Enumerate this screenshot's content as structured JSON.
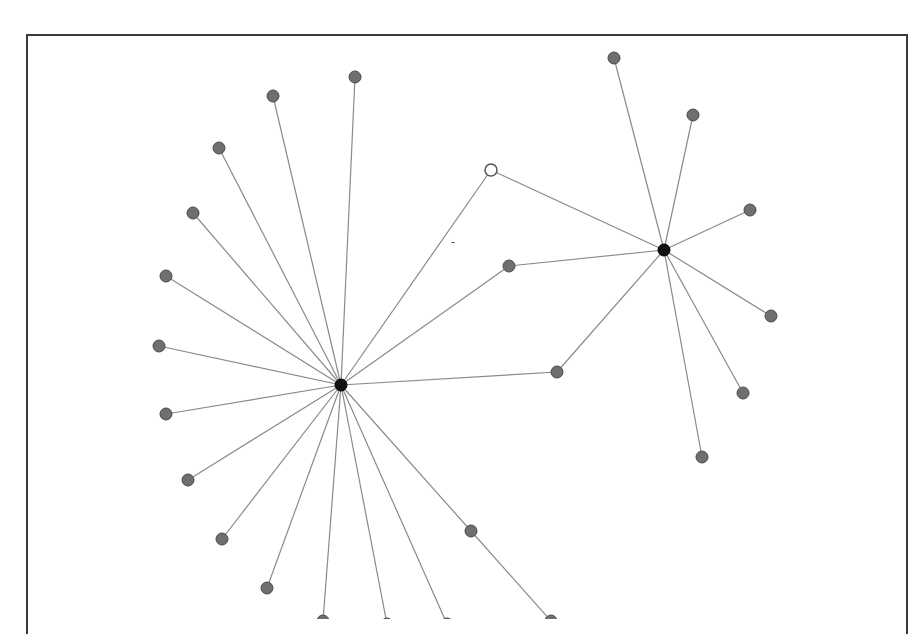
{
  "diagram": {
    "type": "network-graph",
    "title": "",
    "frame": {
      "border_color": "#3a3a3a",
      "background": "#ffffff"
    },
    "colors": {
      "edge": "#8a8a8a",
      "leaf_node": "#6f6f6f",
      "hub_node": "#111111",
      "open_node": "#ffffff"
    },
    "nodes": [
      {
        "id": "hub1",
        "kind": "hub",
        "x": 341,
        "y": 385,
        "r": 6
      },
      {
        "id": "hub2",
        "kind": "hub",
        "x": 664,
        "y": 250,
        "r": 6
      },
      {
        "id": "open1",
        "kind": "open",
        "x": 491,
        "y": 170,
        "r": 6
      },
      {
        "id": "b1",
        "kind": "leaf",
        "x": 509,
        "y": 266,
        "r": 6
      },
      {
        "id": "b2",
        "kind": "leaf",
        "x": 557,
        "y": 372,
        "r": 6
      },
      {
        "id": "a1",
        "kind": "leaf",
        "x": 355,
        "y": 77,
        "r": 6
      },
      {
        "id": "a2",
        "kind": "leaf",
        "x": 273,
        "y": 96,
        "r": 6
      },
      {
        "id": "a3",
        "kind": "leaf",
        "x": 219,
        "y": 148,
        "r": 6
      },
      {
        "id": "a4",
        "kind": "leaf",
        "x": 193,
        "y": 213,
        "r": 6
      },
      {
        "id": "a5",
        "kind": "leaf",
        "x": 166,
        "y": 276,
        "r": 6
      },
      {
        "id": "a6",
        "kind": "leaf",
        "x": 159,
        "y": 346,
        "r": 6
      },
      {
        "id": "a7",
        "kind": "leaf",
        "x": 166,
        "y": 414,
        "r": 6
      },
      {
        "id": "a8",
        "kind": "leaf",
        "x": 188,
        "y": 480,
        "r": 6
      },
      {
        "id": "a9",
        "kind": "leaf",
        "x": 222,
        "y": 539,
        "r": 6
      },
      {
        "id": "a10",
        "kind": "leaf",
        "x": 267,
        "y": 588,
        "r": 6
      },
      {
        "id": "a11",
        "kind": "leaf",
        "x": 323,
        "y": 621,
        "r": 6
      },
      {
        "id": "a12",
        "kind": "leaf",
        "x": 387,
        "y": 624,
        "r": 6
      },
      {
        "id": "a13",
        "kind": "leaf",
        "x": 447,
        "y": 624,
        "r": 6
      },
      {
        "id": "a14",
        "kind": "leaf",
        "x": 471,
        "y": 531,
        "r": 6
      },
      {
        "id": "a15",
        "kind": "leaf",
        "x": 551,
        "y": 621,
        "r": 6
      },
      {
        "id": "c1",
        "kind": "leaf",
        "x": 614,
        "y": 58,
        "r": 6
      },
      {
        "id": "c2",
        "kind": "leaf",
        "x": 693,
        "y": 115,
        "r": 6
      },
      {
        "id": "c3",
        "kind": "leaf",
        "x": 750,
        "y": 210,
        "r": 6
      },
      {
        "id": "c4",
        "kind": "leaf",
        "x": 771,
        "y": 316,
        "r": 6
      },
      {
        "id": "c5",
        "kind": "leaf",
        "x": 743,
        "y": 393,
        "r": 6
      },
      {
        "id": "c6",
        "kind": "leaf",
        "x": 702,
        "y": 457,
        "r": 6
      }
    ],
    "edges": [
      [
        "hub1",
        "a1"
      ],
      [
        "hub1",
        "a2"
      ],
      [
        "hub1",
        "a3"
      ],
      [
        "hub1",
        "a4"
      ],
      [
        "hub1",
        "a5"
      ],
      [
        "hub1",
        "a6"
      ],
      [
        "hub1",
        "a7"
      ],
      [
        "hub1",
        "a8"
      ],
      [
        "hub1",
        "a9"
      ],
      [
        "hub1",
        "a10"
      ],
      [
        "hub1",
        "a11"
      ],
      [
        "hub1",
        "a12"
      ],
      [
        "hub1",
        "a13"
      ],
      [
        "hub1",
        "a14"
      ],
      [
        "a14",
        "a15"
      ],
      [
        "hub1",
        "b1"
      ],
      [
        "hub1",
        "b2"
      ],
      [
        "hub1",
        "open1"
      ],
      [
        "hub2",
        "b1"
      ],
      [
        "hub2",
        "b2"
      ],
      [
        "hub2",
        "open1"
      ],
      [
        "hub2",
        "c1"
      ],
      [
        "hub2",
        "c2"
      ],
      [
        "hub2",
        "c3"
      ],
      [
        "hub2",
        "c4"
      ],
      [
        "hub2",
        "c5"
      ],
      [
        "hub2",
        "c6"
      ]
    ],
    "annotations": [
      {
        "text": "-",
        "x": 451,
        "y": 246
      }
    ]
  }
}
